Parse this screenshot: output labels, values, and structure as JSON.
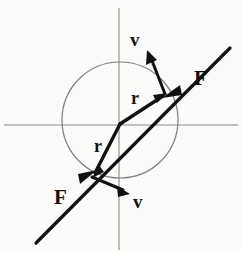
{
  "figure": {
    "kind": "vector-diagram",
    "background_color": "#fbfbf9",
    "stroke_color": "#111111",
    "axis_color": "#8a8a88",
    "circle_color": "#7d7d7b",
    "canvas": {
      "width": 242,
      "height": 254
    },
    "geometry": {
      "origin": {
        "x": 120,
        "y": 124
      },
      "circle": {
        "cx": 120,
        "cy": 120,
        "r": 58
      },
      "axis_horizontal": {
        "x1": 4,
        "y1": 125,
        "x2": 238,
        "y2": 125
      },
      "axis_vertical": {
        "x1": 119,
        "y1": 8,
        "x2": 119,
        "y2": 250
      },
      "force_line": {
        "x1": 36,
        "y1": 243,
        "x2": 230,
        "y2": 48
      },
      "point_upper": {
        "x": 165,
        "y": 94
      },
      "point_lower": {
        "x": 92,
        "y": 177
      }
    },
    "labels": [
      {
        "id": "v-upper",
        "text": "v",
        "x": 130,
        "y": 30,
        "size": "lbl-v",
        "name": "velocity-label-upper"
      },
      {
        "id": "f-upper",
        "text": "F",
        "x": 194,
        "y": 68,
        "size": "lbl-f",
        "name": "force-label-upper"
      },
      {
        "id": "r-upper",
        "text": "r",
        "x": 131,
        "y": 89,
        "size": "lbl-r",
        "name": "radius-label-upper"
      },
      {
        "id": "r-lower",
        "text": "r",
        "x": 94,
        "y": 137,
        "size": "lbl-r",
        "name": "radius-label-lower"
      },
      {
        "id": "f-lower",
        "text": "F",
        "x": 54,
        "y": 187,
        "size": "lbl-f",
        "name": "force-label-lower"
      },
      {
        "id": "v-lower",
        "text": "v",
        "x": 133,
        "y": 192,
        "size": "lbl-v",
        "name": "velocity-label-lower"
      }
    ],
    "vectors": {
      "r_upper": {
        "symbol": "r",
        "from": "origin",
        "to": "point_upper",
        "meaning": "radius vector"
      },
      "r_lower": {
        "symbol": "r",
        "from": "origin",
        "to": "point_lower",
        "meaning": "radius vector"
      },
      "v_upper": {
        "symbol": "v",
        "at": "point_upper",
        "direction": "up-left",
        "meaning": "velocity, tangent to circle"
      },
      "v_lower": {
        "symbol": "v",
        "at": "point_lower",
        "direction": "down-right",
        "meaning": "velocity, tangent to circle"
      },
      "F_upper": {
        "symbol": "F",
        "at": "point_upper",
        "direction": "down-left toward center",
        "meaning": "centripetal force"
      },
      "F_lower": {
        "symbol": "F",
        "at": "point_lower",
        "direction": "up-right toward center",
        "meaning": "centripetal force"
      }
    }
  }
}
